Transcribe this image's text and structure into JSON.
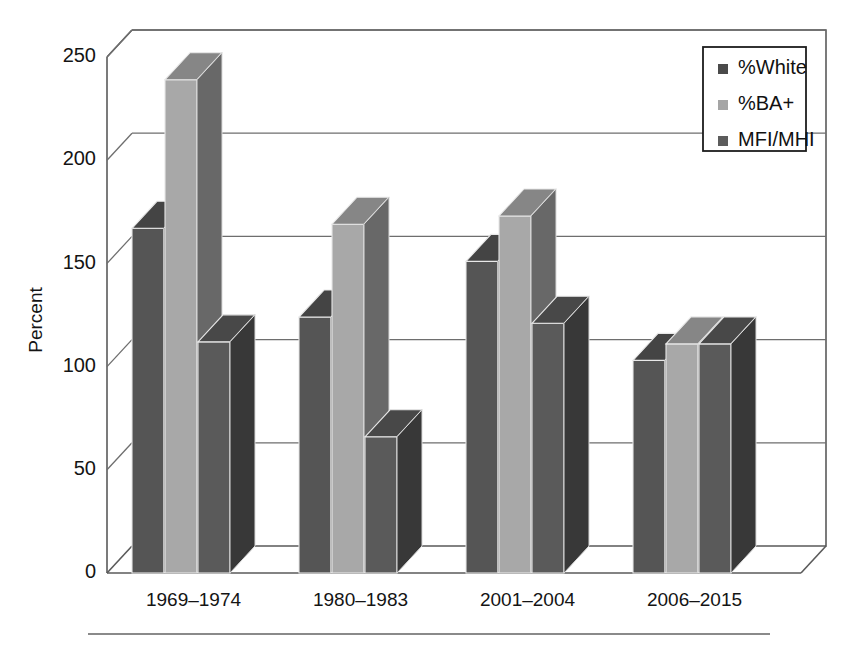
{
  "chart_data": {
    "type": "bar",
    "title": "",
    "subtitle": "",
    "xlabel": "",
    "ylabel": "Percent",
    "ylim": [
      0,
      250
    ],
    "ytick_values": [
      0,
      50,
      100,
      150,
      200,
      250
    ],
    "ytick_labels": [
      "0",
      "50",
      "100",
      "150",
      "200",
      "250"
    ],
    "categories": [
      "1969–1974",
      "1980–1983",
      "2001–2004",
      "2006–2015"
    ],
    "series": [
      {
        "name": "%White",
        "color": "#555555",
        "values": [
          167,
          124,
          151,
          103
        ]
      },
      {
        "name": "%BA+",
        "color": "#a8a8a8",
        "values": [
          239,
          169,
          173,
          111
        ]
      },
      {
        "name": "MFI/MHI",
        "color": "#5a5a5a",
        "values": [
          112,
          66,
          121,
          111
        ]
      }
    ],
    "grid": true,
    "grid_axis": "y",
    "legend_position": "top-right",
    "style": "3d-grouped-bars",
    "annotations": []
  },
  "legend": {
    "items": [
      {
        "label": "%White",
        "swatch_color": "#4a4a4a"
      },
      {
        "label": "%BA+",
        "swatch_color": "#a5a5a5"
      },
      {
        "label": "MFI/MHI",
        "swatch_color": "#5c5c5c"
      }
    ]
  },
  "axes": {
    "y_title": "Percent"
  },
  "footer": {
    "rule": true
  }
}
